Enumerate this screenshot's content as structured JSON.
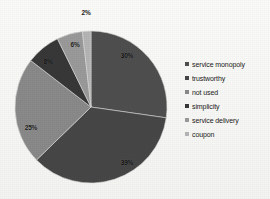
{
  "chart_data": {
    "type": "pie",
    "title": "",
    "labels": [
      "service monopoly",
      "trustworthy",
      "not used",
      "simplicity",
      "service delivery",
      "coupon"
    ],
    "values": [
      30,
      39,
      25,
      8,
      6,
      2
    ],
    "value_labels": [
      "30%",
      "39%",
      "25%",
      "8%",
      "6%",
      "2%"
    ],
    "colors": [
      "#4f4f4f",
      "#474747",
      "#8a8a8a",
      "#383838",
      "#9a9a9a",
      "#b5b5b5"
    ],
    "legend_position": "right",
    "start_angle_deg": 0,
    "direction": "clockwise",
    "units": "percent",
    "grid": false
  },
  "geometry": {
    "center_x": 91,
    "center_y": 107,
    "radius": 76
  },
  "legend": {
    "items": [
      {
        "label": "service monopoly",
        "color": "#4f4f4f"
      },
      {
        "label": "trustworthy",
        "color": "#474747"
      },
      {
        "label": "not used",
        "color": "#8a8a8a"
      },
      {
        "label": "simplicity",
        "color": "#383838"
      },
      {
        "label": "service delivery",
        "color": "#9a9a9a"
      },
      {
        "label": "coupon",
        "color": "#b5b5b5"
      }
    ]
  },
  "slice_labels": [
    {
      "text": "30%",
      "x": 127,
      "y": 55,
      "tone": "on-dark"
    },
    {
      "text": "39%",
      "x": 127,
      "y": 162,
      "tone": "on-dark"
    },
    {
      "text": "25%",
      "x": 31,
      "y": 127,
      "tone": "on-light"
    },
    {
      "text": "8%",
      "x": 48,
      "y": 61,
      "tone": "on-dark"
    },
    {
      "text": "6%",
      "x": 75,
      "y": 44,
      "tone": "on-light"
    },
    {
      "text": "2%",
      "x": 86,
      "y": 12,
      "tone": "outside"
    }
  ]
}
